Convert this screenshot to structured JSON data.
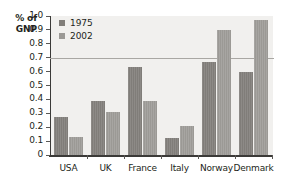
{
  "chart_data": {
    "type": "bar",
    "title": "",
    "xlabel": "",
    "ylabel": "% of GNP",
    "ylabel_lines": [
      "% of",
      "GNP"
    ],
    "categories": [
      "USA",
      "UK",
      "France",
      "Italy",
      "Norway",
      "Denmark"
    ],
    "series": [
      {
        "name": "1975",
        "color": "#807d79",
        "values": [
          0.27,
          0.39,
          0.63,
          0.12,
          0.67,
          0.6
        ]
      },
      {
        "name": "2002",
        "color": "#9b9995",
        "values": [
          0.13,
          0.31,
          0.39,
          0.21,
          0.9,
          0.97
        ]
      }
    ],
    "ylim": [
      0,
      1.0
    ],
    "ytick_labels": [
      "1.0",
      "0.9",
      "0.8",
      "0.7",
      "0.6",
      "0.5",
      "0.4",
      "0.3",
      "0.2",
      "0.1",
      "0"
    ],
    "ytick_values": [
      1.0,
      0.9,
      0.8,
      0.7,
      0.6,
      0.5,
      0.4,
      0.3,
      0.2,
      0.1,
      0
    ],
    "grid": false,
    "reference_line": {
      "value": 0.7,
      "color": "#a9a7a3"
    },
    "legend": {
      "position": "top-left-inside",
      "entries": [
        {
          "label": "1975",
          "color": "#807d79"
        },
        {
          "label": "2002",
          "color": "#9b9995"
        }
      ]
    },
    "plot_background": "#f1f0ee",
    "axis_color": "#3b3a38"
  }
}
